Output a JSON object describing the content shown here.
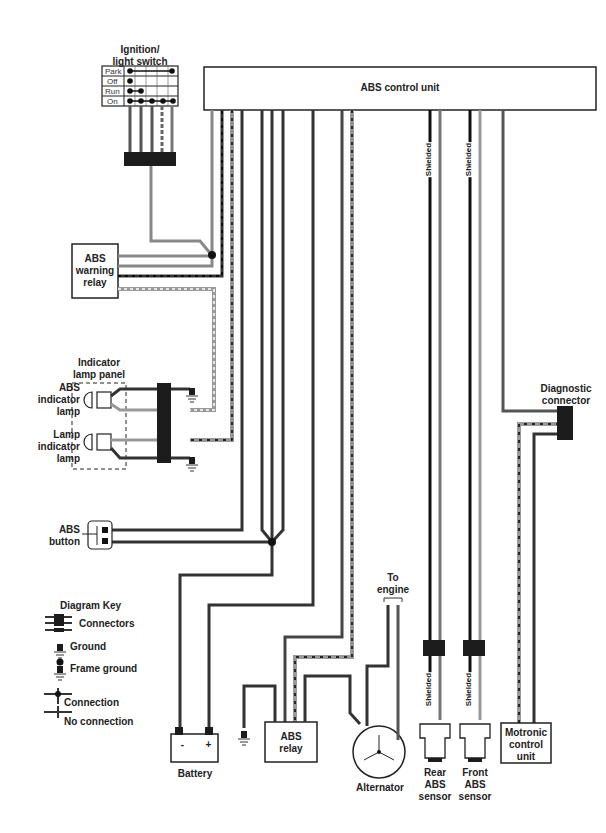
{
  "diagram": {
    "components": {
      "ignition_switch": {
        "label": "Ignition/\nlight switch",
        "rows": [
          "Park",
          "Off",
          "Run",
          "On"
        ]
      },
      "abs_control_unit": {
        "label": "ABS control unit"
      },
      "abs_warning_relay": {
        "label": "ABS\nwarning\nrelay"
      },
      "indicator_lamp_panel": {
        "label": "Indicator\nlamp panel"
      },
      "abs_indicator_lamp": {
        "label": "ABS\nindicator\nlamp"
      },
      "lamp_indicator_lamp": {
        "label": "Lamp\nindicator\nlamp"
      },
      "abs_button": {
        "label": "ABS\nbutton"
      },
      "battery": {
        "label": "Battery",
        "neg": "-",
        "pos": "+"
      },
      "abs_relay": {
        "label": "ABS\nrelay"
      },
      "alternator": {
        "label": "Alternator"
      },
      "to_engine": {
        "label": "To\nengine"
      },
      "rear_abs_sensor": {
        "label": "Rear\nABS\nsensor"
      },
      "front_abs_sensor": {
        "label": "Front\nABS\nsensor"
      },
      "motronic_control_unit": {
        "label": "Motronic\ncontrol\nunit"
      },
      "diagnostic_connector": {
        "label": "Diagnostic\nconnector"
      }
    },
    "shield_labels": [
      "Shielded",
      "Shielded",
      "Shielded",
      "Shielded"
    ],
    "key": {
      "title": "Diagram Key",
      "items": [
        "Connectors",
        "Ground",
        "Frame ground",
        "Connection",
        "No connection"
      ]
    },
    "colors": {
      "wire_dark": "#3a3a3a",
      "wire_gray": "#8a8a8a",
      "wire_black": "#1a1a1a",
      "connector": "#1c1c1c"
    }
  }
}
